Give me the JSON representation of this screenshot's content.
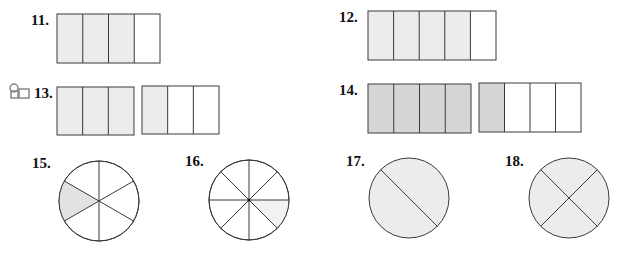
{
  "colors": {
    "stroke": "#3a3a3a",
    "light_fill": "#ececec",
    "dark_fill": "#d6d6d6",
    "empty_fill": "#ffffff"
  },
  "problems": [
    {
      "number": "11.",
      "type": "rectangle",
      "groups": [
        {
          "parts": 4,
          "shaded": 3
        }
      ]
    },
    {
      "number": "12.",
      "type": "rectangle",
      "groups": [
        {
          "parts": 5,
          "shaded": 4
        }
      ]
    },
    {
      "number": "13.",
      "type": "rectangle",
      "groups": [
        {
          "parts": 3,
          "shaded": 3
        },
        {
          "parts": 3,
          "shaded": 1
        }
      ]
    },
    {
      "number": "14.",
      "type": "rectangle",
      "groups": [
        {
          "parts": 4,
          "shaded": 4
        },
        {
          "parts": 4,
          "shaded": 1
        }
      ]
    },
    {
      "number": "15.",
      "type": "circle",
      "parts": 6,
      "shaded": 1
    },
    {
      "number": "16.",
      "type": "circle",
      "parts": 8,
      "shaded": 1
    },
    {
      "number": "17.",
      "type": "circle",
      "parts": 2,
      "shaded": 2
    },
    {
      "number": "18.",
      "type": "circle",
      "parts": 4,
      "shaded": 4
    }
  ],
  "icons": {
    "problem_13_marker": "video-tutorial-icon"
  }
}
